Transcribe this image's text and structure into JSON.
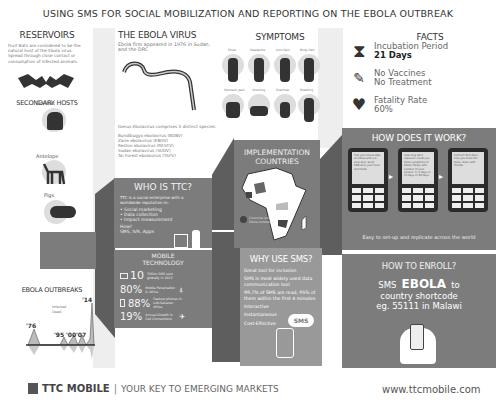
{
  "title": "USING SMS FOR SOCIAL MOBILIZATION AND REPORTING ON THE EBOLA OUTBREAK",
  "reservoirs": {
    "heading": "RESERVOIRS",
    "text": "Fruit Bats are considered to be the natural host of the Ebola virus. Spread through close contact or consumption of infected animals.",
    "secondary_heading": "SECONDARY HOSTS",
    "hosts": [
      {
        "label": "Gorillas"
      },
      {
        "label": "Antelope"
      },
      {
        "label": "Pigs"
      }
    ]
  },
  "virus": {
    "heading": "THE EBOLA VIRUS",
    "intro": "Ebola first appeared in 1976 in Sudan, and the DRC",
    "genus": "Genus Ebolavirus comprises 5 distinct species:",
    "species": [
      "Bundibugyo ebolavirus (BDBV)",
      "Zaire ebolavirus (EBOV)",
      "Reston ebolavirus (RESTV)",
      "Sudan ebolavirus (SUDV)",
      "Tai Forest ebolavirus (TAFV)"
    ]
  },
  "symptoms": {
    "heading": "SYMPTOMS",
    "items": [
      {
        "label": "Fever"
      },
      {
        "label": "Headache"
      },
      {
        "label": "Joint Pain"
      },
      {
        "label": "Body Pain"
      },
      {
        "label": "Stomach pain"
      },
      {
        "label": "Vomiting"
      },
      {
        "label": "Diarrhea"
      },
      {
        "label": "Bleeding"
      }
    ]
  },
  "facts": {
    "heading": "FACTS",
    "items": [
      {
        "icon": "hourglass-icon",
        "line1": "Incubation Period",
        "line2": "21 Days"
      },
      {
        "icon": "syringe-icon",
        "line1": "No Vaccines",
        "line2": "No Treatment"
      },
      {
        "icon": "heartbeat-icon",
        "line1": "Fatality Rate",
        "line2": "60%"
      }
    ]
  },
  "how": {
    "heading": "HOW DOES IT WORK?",
    "phones": [
      {
        "text": "Test your knowledge on Ebola with a 4-step quiz. Send EBOLA to your local shortcode"
      },
      {
        "text": "How long after exposure could you show symptoms of Ebola? Reply with number of your answer: 1) 2 days 2) 21 days 3) 90 days",
        "reply": "REPLY 2"
      },
      {
        "text": "Correct! Well done, now you know the facts, share with friends",
        "reply": "SHARE"
      }
    ],
    "caption": "Easy to set-up and replicate across the world"
  },
  "implementation": {
    "heading_1": "IMPLEMENTATION",
    "heading_2": "COUNTRIES",
    "legend": "Countries with Ebola outbreaks"
  },
  "who": {
    "heading": "WHO IS TTC?",
    "intro": "TTC is a social enterprise with a worldwide reputation in:",
    "bullets": [
      "• Social marketing",
      "• Data collection",
      "• Impact measurement"
    ],
    "how_label": "How?",
    "how_value": "SMS, IVR, Apps"
  },
  "mobile": {
    "heading_1": "MOBILE",
    "heading_2": "TECHNOLOGY",
    "stats": [
      {
        "value": "10",
        "text": "Trillion SMS sent globally in 2013"
      },
      {
        "value": "80%",
        "text": "Mobile Penetration in Africa"
      },
      {
        "value": "88%",
        "text": "Feature phones in sub-Saharan Africa"
      },
      {
        "value": "19%",
        "text": "Annual Growth in Cell Connections"
      }
    ]
  },
  "why": {
    "heading": "WHY USE SMS?",
    "items": [
      "Great tool for inclusion",
      "SMS is most widely used data communication tool",
      "99.7% of SMS are read, 95% of them within the first 4 minutes",
      "Interactive",
      "Instantaneous",
      "Cost-Effective"
    ],
    "bubble": "SMS"
  },
  "enroll": {
    "heading": "HOW TO ENROLL?",
    "prefix": "SMS",
    "keyword": "EBOLA",
    "suffix": "to",
    "line2": "country shortcode",
    "line3": "eg. 55111 in Malawi"
  },
  "outbreaks": {
    "heading": "EBOLA OUTBREAKS",
    "legend": [
      "Infected",
      "Dead"
    ],
    "years": [
      "'76",
      "'95",
      "'00",
      "'07",
      "'14"
    ]
  },
  "footer": {
    "brand": "TTC MOBILE",
    "tagline": "YOUR KEY TO EMERGING MARKETS",
    "url": "www.ttcmobile.com"
  },
  "colors": {
    "dark": "#5e5e5e",
    "mid": "#7c7c7c",
    "light": "#eeeeee",
    "text": "#444444"
  }
}
